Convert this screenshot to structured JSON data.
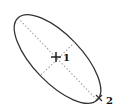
{
  "diagram": {
    "shape": "ellipse",
    "colors": {
      "outline": "#333333",
      "axis": "#9a9a9a",
      "marker": "#222222",
      "label": "#111111",
      "background": "#ffffff"
    },
    "center_marker": {
      "symbol": "crosshair",
      "label": "1"
    },
    "endpoint_marker": {
      "symbol": "x-mark",
      "label": "2"
    },
    "axes": [
      {
        "name": "major-axis",
        "style": "dotted"
      },
      {
        "name": "minor-axis",
        "style": "dotted"
      }
    ]
  }
}
